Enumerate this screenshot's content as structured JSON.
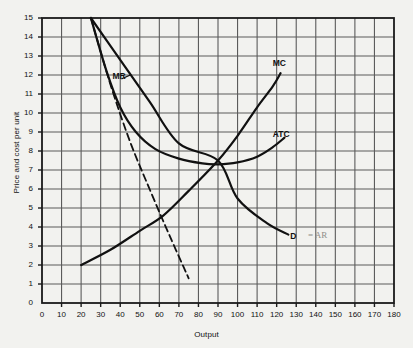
{
  "chart_data": {
    "type": "line",
    "title": "",
    "xlabel": "Output",
    "ylabel": "Price and cost per unit",
    "xlim": [
      0,
      180
    ],
    "ylim": [
      0,
      15
    ],
    "xticks": [
      0,
      10,
      20,
      30,
      40,
      50,
      60,
      70,
      80,
      90,
      100,
      110,
      120,
      130,
      140,
      150,
      160,
      170,
      180
    ],
    "yticks": [
      0,
      1,
      2,
      3,
      4,
      5,
      6,
      7,
      8,
      9,
      10,
      11,
      12,
      13,
      14,
      15
    ],
    "grid": true,
    "legend": "inline-labels",
    "equilibrium": {
      "x": 90,
      "y": 7.5
    },
    "series": [
      {
        "name": "D = AR",
        "label": "D",
        "style": "solid",
        "points": [
          [
            25,
            15
          ],
          [
            40,
            12.8
          ],
          [
            55,
            10.6
          ],
          [
            70,
            8.4
          ],
          [
            90,
            7.5
          ],
          [
            100,
            5.5
          ],
          [
            115,
            4.2
          ],
          [
            126,
            3.6
          ]
        ]
      },
      {
        "name": "MR",
        "label": "MR",
        "style": "dashed",
        "points": [
          [
            25,
            15
          ],
          [
            35,
            11.5
          ],
          [
            45,
            8.5
          ],
          [
            55,
            6.0
          ],
          [
            65,
            3.6
          ],
          [
            75,
            1.3
          ]
        ]
      },
      {
        "name": "ATC",
        "label": "ATC",
        "style": "solid",
        "points": [
          [
            25,
            15
          ],
          [
            33,
            12.2
          ],
          [
            40,
            10.3
          ],
          [
            48,
            9.0
          ],
          [
            58,
            8.1
          ],
          [
            70,
            7.6
          ],
          [
            82,
            7.35
          ],
          [
            90,
            7.3
          ],
          [
            100,
            7.4
          ],
          [
            110,
            7.7
          ],
          [
            118,
            8.2
          ],
          [
            124,
            8.7
          ]
        ]
      },
      {
        "name": "MC",
        "label": "MC",
        "style": "solid",
        "points": [
          [
            20,
            2.0
          ],
          [
            35,
            2.8
          ],
          [
            50,
            3.8
          ],
          [
            62,
            4.6
          ],
          [
            75,
            5.9
          ],
          [
            90,
            7.5
          ],
          [
            100,
            8.8
          ],
          [
            110,
            10.3
          ],
          [
            118,
            11.4
          ],
          [
            122,
            12.1
          ]
        ]
      }
    ],
    "curve_labels": [
      {
        "text": "MR",
        "x": 36,
        "y": 11.9
      },
      {
        "text": "MC",
        "x": 118,
        "y": 12.6
      },
      {
        "text": "ATC",
        "x": 118,
        "y": 8.85
      },
      {
        "text": "D",
        "x": 127,
        "y": 3.45
      }
    ],
    "annotations": [
      {
        "text": "= AR",
        "x": 136,
        "y": 3.5,
        "style": "handwritten-pencil"
      }
    ],
    "colors": {
      "background": "#f2f2ef",
      "grid": "#5b5b5b",
      "axis": "#1a1a1a",
      "curve": "#111111",
      "text": "#111111",
      "annotation": "#8d8d88"
    }
  }
}
